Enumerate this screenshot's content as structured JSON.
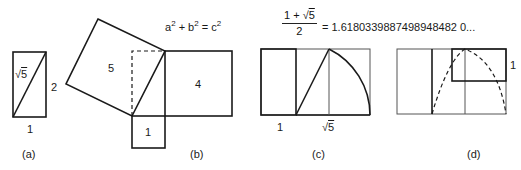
{
  "panels": {
    "a": {
      "caption": "(a)",
      "diagonal_label_symbol": "√",
      "diagonal_label_radicand": "5",
      "height_label": "2",
      "width_label": "1"
    },
    "b": {
      "caption": "(b)",
      "equation_a": "a",
      "equation_plus": " + b",
      "equation_eq": " = c",
      "exponent": "2",
      "square_hypotenuse_label": "5",
      "square_long_leg_label": "4",
      "square_short_leg_label": "1"
    },
    "c": {
      "caption": "(c)",
      "formula_numerator_prefix": "1 + ",
      "formula_numerator_symbol": "√",
      "formula_numerator_radicand": "5",
      "formula_denominator": "2",
      "formula_value": "= 1.6180339887498948482 0...",
      "width_label_left": "1",
      "width_label_right_symbol": "√",
      "width_label_right_radicand": "5"
    },
    "d": {
      "caption": "(d)",
      "side_label": "1"
    }
  },
  "colors": {
    "stroke": "#1a1a1a",
    "thin_stroke": "#555555",
    "background": "#ffffff"
  }
}
